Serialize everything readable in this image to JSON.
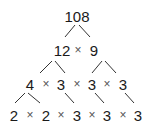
{
  "root": "108",
  "times": "×",
  "row1": [
    "12",
    "9"
  ],
  "row2": [
    "4",
    "3",
    "3",
    "3"
  ],
  "row3": [
    "2",
    "2",
    "3",
    "3",
    "3"
  ]
}
